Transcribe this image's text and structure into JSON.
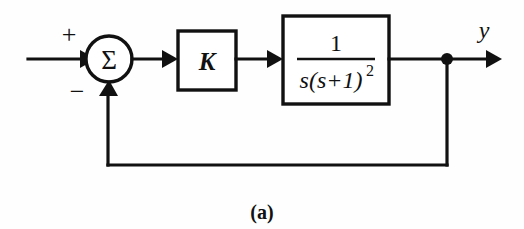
{
  "figure": {
    "caption": "(a)",
    "type": "control-system-block-diagram",
    "background_color": "#fefefe",
    "line_color": "#111111"
  },
  "summing_junction": {
    "symbol": "Σ",
    "positive_sign": "+",
    "negative_sign": "−",
    "center_x": 109,
    "center_y": 59,
    "radius": 23
  },
  "gain_block": {
    "label": "K",
    "x": 178,
    "y": 31,
    "width": 58,
    "height": 59
  },
  "plant_block": {
    "numerator": "1",
    "denominator_base": "s(s+1)",
    "denominator_exponent": "2",
    "transfer_function": "1/(s(s+1)^2)",
    "x": 283,
    "y": 16,
    "width": 106,
    "height": 88
  },
  "output": {
    "label": "y",
    "node_x": 447,
    "node_y": 59,
    "node_radius": 6,
    "arrow_end_x": 502
  },
  "input": {
    "start_x": 28,
    "y": 59
  },
  "feedback_path": {
    "bottom_y": 165,
    "from_x": 447,
    "to_x": 108
  }
}
